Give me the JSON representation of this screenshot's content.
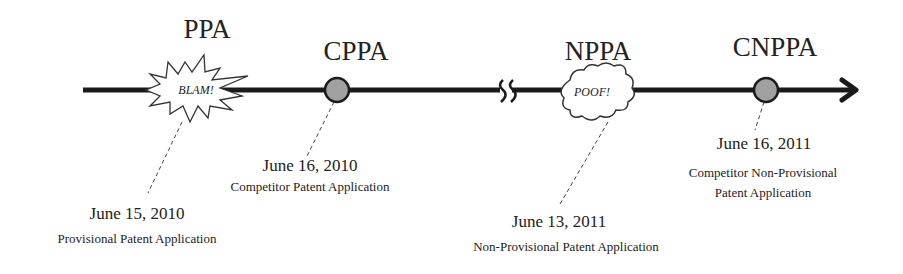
{
  "diagram": {
    "type": "timeline",
    "events": [
      {
        "id": "ppa",
        "label": "PPA",
        "marker": "burst",
        "marker_text": "BLAM!",
        "date": "June 15, 2010",
        "description": "Provisional Patent Application"
      },
      {
        "id": "cppa",
        "label": "CPPA",
        "marker": "circle",
        "date": "June 16, 2010",
        "description": "Competitor Patent Application"
      },
      {
        "id": "nppa",
        "label": "NPPA",
        "marker": "cloud",
        "marker_text": "POOF!",
        "date": "June 13, 2011",
        "description": "Non-Provisional Patent Application"
      },
      {
        "id": "cnppa",
        "label": "CNPPA",
        "marker": "circle",
        "date": "June 16, 2011",
        "description_line1": "Competitor Non-Provisional",
        "description_line2": "Patent Application"
      }
    ],
    "colors": {
      "line": "#1a1a1a",
      "circle_fill": "#a0a0a0",
      "text": "#222222"
    }
  }
}
